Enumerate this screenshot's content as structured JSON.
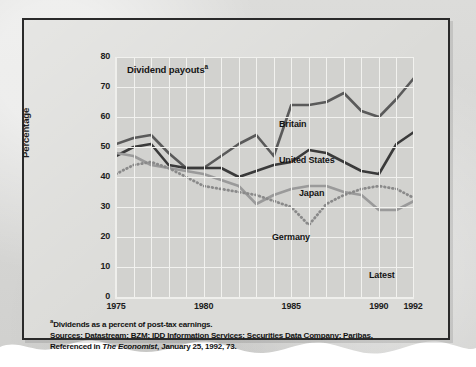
{
  "chart_data": {
    "type": "line",
    "title": "Dividend payouts",
    "title_superscript": "a",
    "xlabel": "",
    "ylabel": "Percentage",
    "ylim": [
      0,
      80
    ],
    "xlim": [
      1975,
      1992
    ],
    "yticks": [
      80,
      70,
      60,
      50,
      40,
      30,
      20,
      10,
      0
    ],
    "xticks": [
      1975,
      1980,
      1985,
      1990,
      1992
    ],
    "grid": true,
    "legend_position": "inline-labels",
    "annotations": [
      "Latest"
    ],
    "x": [
      1975,
      1976,
      1977,
      1978,
      1979,
      1980,
      1981,
      1982,
      1983,
      1984,
      1985,
      1986,
      1987,
      1988,
      1989,
      1990,
      1991,
      1992
    ],
    "series": [
      {
        "name": "Britain",
        "color": "#5a5a5a",
        "style": "solid",
        "values": [
          51,
          53,
          54,
          48,
          43,
          43,
          47,
          51,
          54,
          47,
          64,
          64,
          65,
          68,
          62,
          60,
          66,
          73
        ]
      },
      {
        "name": "United States",
        "color": "#3a3a3a",
        "style": "solid",
        "values": [
          47,
          50,
          51,
          44,
          43,
          43,
          43,
          40,
          42,
          44,
          45,
          49,
          48,
          45,
          42,
          41,
          51,
          55
        ]
      },
      {
        "name": "Japan",
        "color": "#9a9a9a",
        "style": "solid",
        "values": [
          48,
          47,
          44,
          43,
          42,
          41,
          39,
          37,
          31,
          34,
          36,
          37,
          37,
          35,
          34,
          29,
          29,
          32
        ]
      },
      {
        "name": "Germany",
        "color": "#8a8a8a",
        "style": "dotted",
        "values": [
          41,
          44,
          45,
          43,
          40,
          37,
          36,
          35,
          34,
          32,
          30,
          24,
          31,
          34,
          36,
          37,
          36,
          33
        ]
      }
    ]
  },
  "footnote": {
    "superscript": "a",
    "line1": "Dividends as a percent of post-tax earnings.",
    "line2": "Sources: Datastream; BZM; IDD Information Services; Securities Data Company; Paribas,",
    "line3_pre": "Referenced in ",
    "line3_em": "The Economist",
    "line3_post": ", January 25, 1992, 73."
  },
  "labels": {
    "britain": "Britain",
    "united_states": "United States",
    "japan": "Japan",
    "germany": "Germany",
    "latest": "Latest"
  }
}
